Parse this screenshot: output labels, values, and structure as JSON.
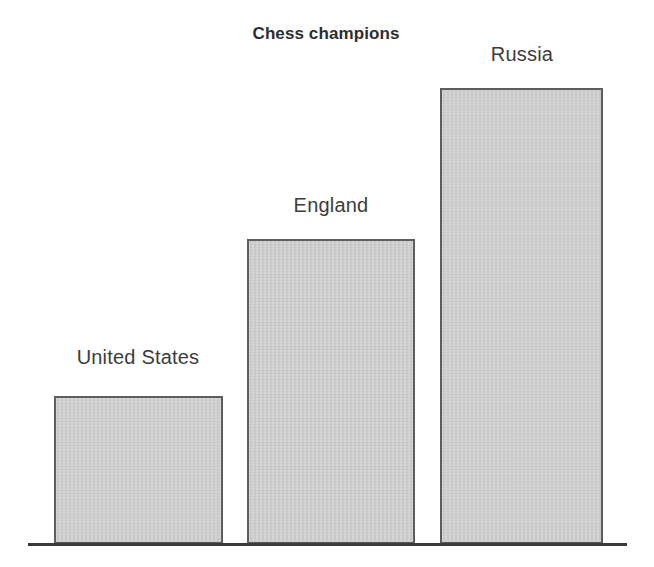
{
  "chart_data": {
    "type": "bar",
    "title": "Chess champions",
    "subtitle": "",
    "xlabel": "",
    "ylabel": "",
    "categories": [
      "United States",
      "England",
      "Russia"
    ],
    "values": [
      1,
      2.07,
      3.1
    ],
    "data_labels": [
      "United States",
      "England",
      "Russia"
    ],
    "label_position": "above-bar",
    "ylim": [
      0,
      3.35
    ],
    "grid": false,
    "legend": false,
    "legend_position": "none",
    "annotations": [],
    "axis": {
      "baseline_visible": true,
      "y_axis_visible": false,
      "tick_labels": []
    },
    "style": {
      "background": "#ffffff",
      "bar_fill": "#cbcbcb",
      "bar_border": "#5e5e5e",
      "axis_color": "#3a3a3a",
      "title_color": "#2e2e2e",
      "label_color": "#3c3c3c"
    },
    "geometry": {
      "bars": [
        {
          "name": "United States",
          "x": 54,
          "y": 396,
          "width": 169,
          "height": 148,
          "label_x": 53,
          "label_y": 346,
          "label_width": 170
        },
        {
          "name": "England",
          "x": 247,
          "y": 239,
          "width": 168,
          "height": 305,
          "label_x": 246,
          "label_y": 194,
          "label_width": 170
        },
        {
          "name": "Russia",
          "x": 440,
          "y": 88,
          "width": 163,
          "height": 456,
          "label_x": 437,
          "label_y": 43,
          "label_width": 170
        }
      ]
    }
  }
}
